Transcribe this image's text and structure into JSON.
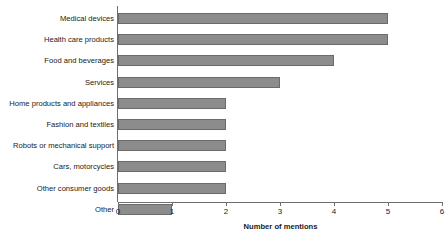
{
  "chart_data": {
    "type": "bar",
    "orientation": "horizontal",
    "title": "",
    "xlabel": "Number of mentions",
    "ylabel": "",
    "categories": [
      "Medical devices",
      "Health care products",
      "Food and beverages",
      "Services",
      "Home products and appliances",
      "Fashion and textiles",
      "Robots or mechanical support",
      "Cars, motorcycles",
      "Other consumer goods",
      "Other"
    ],
    "values": [
      5,
      5,
      4,
      3,
      2,
      2,
      2,
      2,
      2,
      1
    ],
    "xlim": [
      0,
      6
    ],
    "xticks": [
      "0",
      "1",
      "2",
      "3",
      "4",
      "5",
      "6"
    ],
    "grid": false,
    "legend": null,
    "bar_color": "#8c8c8c",
    "bar_edge_color": "#6b6b6b",
    "axis_color": "#6e6e6e"
  }
}
